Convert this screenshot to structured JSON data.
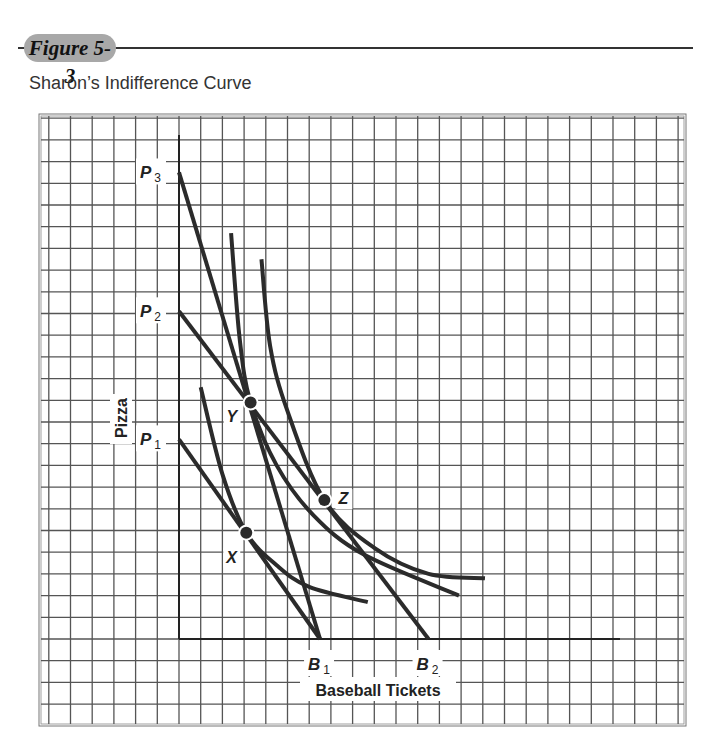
{
  "figure": {
    "label": "Figure 5-3",
    "title": "Sharon’s Indifference Curve"
  },
  "colors": {
    "grid": "#555555",
    "curve": "#2b2b2b",
    "badge": "#a8a8a8",
    "text": "#222222"
  },
  "chart_data": {
    "type": "line",
    "title": "Sharon’s Indifference Curve",
    "xlabel": "Baseball Tickets",
    "ylabel": "Pizza",
    "grid": true,
    "units": "grid squares from origin (approx.)",
    "xlim": [
      0,
      20
    ],
    "ylim": [
      0,
      23
    ],
    "x_tick_labels": [
      {
        "label": "B1",
        "x": 6.5
      },
      {
        "label": "B2",
        "x": 11.5
      }
    ],
    "y_tick_labels": [
      {
        "label": "P1",
        "y": 9.2
      },
      {
        "label": "P2",
        "y": 15.1
      },
      {
        "label": "P3",
        "y": 21.5
      }
    ],
    "series": [
      {
        "name": "Budget line P3–B1",
        "kind": "budget",
        "points": [
          [
            0,
            21.5
          ],
          [
            6.5,
            0
          ]
        ]
      },
      {
        "name": "Budget line P2–B2",
        "kind": "budget",
        "points": [
          [
            0,
            15.1
          ],
          [
            11.5,
            0
          ]
        ]
      },
      {
        "name": "Budget line P1–B1",
        "kind": "budget",
        "points": [
          [
            0,
            9.2
          ],
          [
            6.5,
            0
          ]
        ]
      },
      {
        "name": "Indifference curve (through X)",
        "kind": "indifference",
        "points": [
          [
            1.0,
            11.6
          ],
          [
            2.0,
            7.6
          ],
          [
            3.1,
            4.9
          ],
          [
            4.5,
            3.4
          ],
          [
            6.0,
            2.4
          ],
          [
            8.7,
            1.7
          ]
        ]
      },
      {
        "name": "Indifference curve (through Y)",
        "kind": "indifference",
        "points": [
          [
            2.4,
            18.7
          ],
          [
            2.8,
            13.8
          ],
          [
            3.3,
            10.9
          ],
          [
            4.5,
            8.0
          ],
          [
            6.2,
            5.7
          ],
          [
            8.5,
            3.9
          ],
          [
            12.9,
            2.0
          ]
        ]
      },
      {
        "name": "Indifference curve (through Z)",
        "kind": "indifference",
        "points": [
          [
            3.8,
            17.5
          ],
          [
            4.2,
            13.5
          ],
          [
            5.0,
            10.5
          ],
          [
            6.7,
            6.4
          ],
          [
            9.0,
            4.2
          ],
          [
            11.5,
            3.0
          ],
          [
            14.1,
            2.8
          ]
        ]
      }
    ],
    "points": [
      {
        "label": "X",
        "x": 3.1,
        "y": 4.9
      },
      {
        "label": "Y",
        "x": 3.3,
        "y": 10.9
      },
      {
        "label": "Z",
        "x": 6.7,
        "y": 6.4
      }
    ]
  }
}
